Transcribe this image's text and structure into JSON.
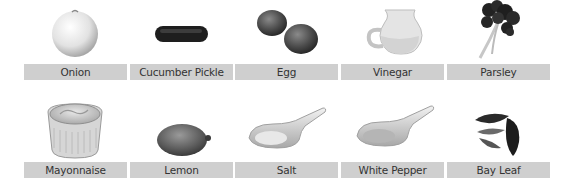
{
  "ingredients": [
    {
      "name": "Onion",
      "icon": "onion-icon"
    },
    {
      "name": "Cucumber Pickle",
      "icon": "cucumber-pickle-icon"
    },
    {
      "name": "Egg",
      "icon": "egg-icon"
    },
    {
      "name": "Vinegar",
      "icon": "vinegar-jug-icon"
    },
    {
      "name": "Parsley",
      "icon": "parsley-icon"
    },
    {
      "name": "Mayonnaise",
      "icon": "mayonnaise-ramekin-icon"
    },
    {
      "name": "Lemon",
      "icon": "lemon-icon"
    },
    {
      "name": "Salt",
      "icon": "salt-spoon-icon"
    },
    {
      "name": "White Pepper",
      "icon": "white-pepper-spoon-icon"
    },
    {
      "name": "Bay Leaf",
      "icon": "bay-leaf-icon"
    }
  ],
  "colors": {
    "label_bg": "#cfcfcf",
    "label_text": "#333333",
    "background": "#ffffff"
  }
}
